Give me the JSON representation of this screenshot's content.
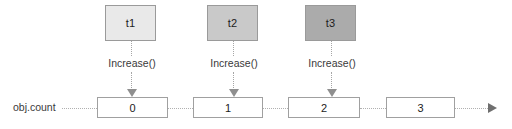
{
  "diagram": {
    "threads": [
      {
        "label": "t1",
        "color": "#e9e9e9",
        "call": "Increase()"
      },
      {
        "label": "t2",
        "color": "#c9c9c9",
        "call": "Increase()"
      },
      {
        "label": "t3",
        "color": "#ababab",
        "call": "Increase()"
      }
    ],
    "timeline": {
      "label": "obj.count",
      "values": [
        "0",
        "1",
        "2",
        "3"
      ],
      "arrow": "timeline-arrow-right"
    },
    "colors": {
      "box_border": "#9a9a9a",
      "value_border": "#a0a0a0",
      "dotted_line": "#b0b0b0",
      "arrow_head": "#8f8f8f",
      "text": "#1c1c1c",
      "background": "#ffffff"
    }
  }
}
